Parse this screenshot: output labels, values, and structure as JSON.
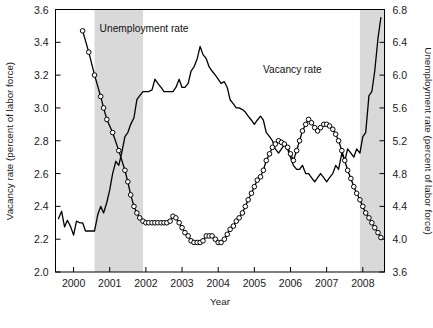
{
  "figure": {
    "background": "#ffffff",
    "plot_border_color": "#000000",
    "recession_band_color": "#d9d9d9",
    "series_color": "#000000"
  },
  "labels": {
    "unemployment_annotation": "Unemployment rate",
    "vacancy_annotation": "Vacancy rate",
    "left_axis_title": "Vacancy rate (percent of labor force)",
    "right_axis_title": "Unemployment rate (percent of labor force)",
    "x_axis_title": "Year"
  },
  "chart_data": {
    "type": "line",
    "title": "",
    "xlabel": "Year",
    "ylabel": "Vacancy rate (percent of labor force)",
    "y2label": "Unemployment rate (percent of labor force)",
    "grid": false,
    "legend_position": "inline-annotations",
    "xlim": [
      1999.5,
      2008.6
    ],
    "xticks": [
      2000,
      2001,
      2002,
      2003,
      2004,
      2005,
      2006,
      2007,
      2008
    ],
    "xtick_labels": [
      "2000",
      "2001",
      "2002",
      "2003",
      "2004",
      "2005",
      "2006",
      "2007",
      "2008"
    ],
    "ylim": [
      2.0,
      3.6
    ],
    "yticks": [
      2.0,
      2.2,
      2.4,
      2.6,
      2.8,
      3.0,
      3.2,
      3.4,
      3.6
    ],
    "ytick_labels": [
      "2.0",
      "2.2",
      "2.4",
      "2.6",
      "2.8",
      "3.0",
      "3.2",
      "3.4",
      "3.6"
    ],
    "y2lim": [
      3.6,
      6.8
    ],
    "y2ticks": [
      3.6,
      4.0,
      4.4,
      4.8,
      5.2,
      5.6,
      6.0,
      6.4,
      6.8
    ],
    "y2tick_labels": [
      "3.6",
      "4.0",
      "4.4",
      "4.8",
      "5.2",
      "5.6",
      "6.0",
      "6.4",
      "6.8"
    ],
    "annotations": [
      {
        "text": "Unemployment rate",
        "x": 2001.95,
        "y_axis": "left",
        "y": 3.46
      },
      {
        "text": "Vacancy rate",
        "x": 2006.05,
        "y_axis": "left",
        "y": 3.21
      }
    ],
    "shaded_regions": [
      {
        "name": "recession-2001",
        "x_start": 2000.58,
        "x_end": 2001.92,
        "color": "#d9d9d9"
      },
      {
        "name": "recession-2007",
        "x_start": 2007.92,
        "x_end": 2008.62,
        "color": "#d9d9d9"
      }
    ],
    "series": [
      {
        "name": "Vacancy rate",
        "axis": "left",
        "marker": "open-circle",
        "x": [
          2000.25,
          2000.42,
          2000.58,
          2000.75,
          2000.83,
          2000.92,
          2001.08,
          2001.25,
          2001.42,
          2001.5,
          2001.58,
          2001.67,
          2001.75,
          2001.83,
          2001.92,
          2002.0,
          2002.08,
          2002.17,
          2002.25,
          2002.33,
          2002.42,
          2002.5,
          2002.58,
          2002.67,
          2002.75,
          2002.83,
          2002.92,
          2003.0,
          2003.08,
          2003.17,
          2003.25,
          2003.33,
          2003.42,
          2003.5,
          2003.58,
          2003.67,
          2003.75,
          2003.83,
          2003.92,
          2004.0,
          2004.08,
          2004.17,
          2004.25,
          2004.33,
          2004.42,
          2004.5,
          2004.58,
          2004.67,
          2004.75,
          2004.83,
          2004.92,
          2005.0,
          2005.08,
          2005.17,
          2005.25,
          2005.33,
          2005.42,
          2005.5,
          2005.58,
          2005.67,
          2005.75,
          2005.83,
          2005.92,
          2006.0,
          2006.08,
          2006.17,
          2006.25,
          2006.33,
          2006.42,
          2006.5,
          2006.58,
          2006.67,
          2006.75,
          2006.83,
          2006.92,
          2007.0,
          2007.08,
          2007.17,
          2007.25,
          2007.33,
          2007.42,
          2007.5,
          2007.58,
          2007.67,
          2007.75,
          2007.83,
          2007.92,
          2008.0,
          2008.08,
          2008.17,
          2008.25,
          2008.33,
          2008.42,
          2008.5
        ],
        "values": [
          3.47,
          3.34,
          3.2,
          3.07,
          3.0,
          2.93,
          2.85,
          2.74,
          2.62,
          2.55,
          2.47,
          2.4,
          2.36,
          2.33,
          2.31,
          2.3,
          2.3,
          2.3,
          2.3,
          2.3,
          2.3,
          2.3,
          2.3,
          2.31,
          2.34,
          2.33,
          2.3,
          2.27,
          2.24,
          2.22,
          2.19,
          2.18,
          2.18,
          2.18,
          2.19,
          2.22,
          2.22,
          2.22,
          2.2,
          2.18,
          2.18,
          2.2,
          2.23,
          2.26,
          2.28,
          2.31,
          2.33,
          2.36,
          2.4,
          2.44,
          2.48,
          2.52,
          2.56,
          2.58,
          2.62,
          2.68,
          2.72,
          2.76,
          2.78,
          2.8,
          2.79,
          2.78,
          2.76,
          2.72,
          2.68,
          2.74,
          2.8,
          2.86,
          2.9,
          2.93,
          2.91,
          2.88,
          2.86,
          2.88,
          2.9,
          2.9,
          2.89,
          2.87,
          2.84,
          2.8,
          2.74,
          2.68,
          2.62,
          2.57,
          2.52,
          2.48,
          2.44,
          2.4,
          2.36,
          2.33,
          2.3,
          2.27,
          2.24,
          2.21
        ]
      },
      {
        "name": "Unemployment rate",
        "axis": "right",
        "marker": "none",
        "x": [
          1999.58,
          1999.67,
          1999.75,
          1999.83,
          1999.92,
          2000.0,
          2000.08,
          2000.17,
          2000.25,
          2000.33,
          2000.42,
          2000.5,
          2000.58,
          2000.67,
          2000.75,
          2000.83,
          2000.92,
          2001.0,
          2001.08,
          2001.17,
          2001.25,
          2001.33,
          2001.42,
          2001.5,
          2001.58,
          2001.67,
          2001.75,
          2001.83,
          2001.92,
          2002.0,
          2002.08,
          2002.17,
          2002.25,
          2002.33,
          2002.42,
          2002.5,
          2002.58,
          2002.67,
          2002.75,
          2002.83,
          2002.92,
          2003.0,
          2003.08,
          2003.17,
          2003.25,
          2003.33,
          2003.42,
          2003.5,
          2003.58,
          2003.67,
          2003.75,
          2003.83,
          2003.92,
          2004.0,
          2004.08,
          2004.17,
          2004.25,
          2004.33,
          2004.42,
          2004.5,
          2004.58,
          2004.67,
          2004.75,
          2004.83,
          2004.92,
          2005.0,
          2005.08,
          2005.17,
          2005.25,
          2005.33,
          2005.42,
          2005.5,
          2005.58,
          2005.67,
          2005.75,
          2005.83,
          2005.92,
          2006.0,
          2006.08,
          2006.17,
          2006.25,
          2006.33,
          2006.42,
          2006.5,
          2006.58,
          2006.67,
          2006.75,
          2006.83,
          2006.92,
          2007.0,
          2007.08,
          2007.17,
          2007.25,
          2007.33,
          2007.42,
          2007.5,
          2007.58,
          2007.67,
          2007.75,
          2007.83,
          2007.92,
          2008.0,
          2008.08,
          2008.17,
          2008.25,
          2008.33,
          2008.42,
          2008.5
        ],
        "values": [
          4.25,
          4.34,
          4.15,
          4.23,
          4.15,
          4.05,
          4.22,
          4.2,
          4.2,
          4.1,
          4.1,
          4.1,
          4.1,
          4.3,
          4.4,
          4.32,
          4.45,
          4.6,
          4.8,
          4.95,
          4.9,
          5.05,
          5.25,
          5.3,
          5.4,
          5.48,
          5.7,
          5.75,
          5.8,
          5.8,
          5.8,
          5.82,
          5.95,
          5.9,
          5.85,
          5.8,
          5.8,
          5.8,
          5.8,
          5.85,
          5.95,
          5.85,
          5.85,
          5.9,
          6.05,
          6.1,
          6.2,
          6.35,
          6.25,
          6.2,
          6.1,
          6.05,
          6.0,
          5.95,
          5.9,
          5.92,
          5.85,
          5.7,
          5.65,
          5.6,
          5.6,
          5.58,
          5.55,
          5.5,
          5.45,
          5.4,
          5.45,
          5.5,
          5.45,
          5.3,
          5.25,
          5.2,
          5.1,
          5.05,
          5.1,
          5.15,
          5.1,
          5.0,
          4.9,
          4.85,
          4.85,
          4.9,
          4.8,
          4.8,
          4.75,
          4.7,
          4.75,
          4.8,
          4.75,
          4.7,
          4.75,
          4.8,
          4.9,
          4.85,
          5.05,
          4.95,
          5.1,
          5.05,
          5.0,
          5.1,
          5.05,
          5.25,
          5.3,
          5.75,
          5.8,
          6.05,
          6.45,
          6.7
        ]
      }
    ]
  }
}
